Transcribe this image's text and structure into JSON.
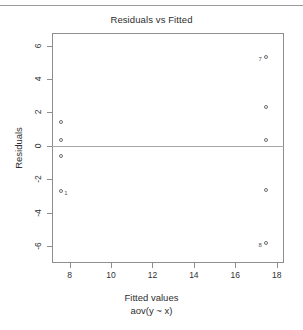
{
  "figure": {
    "title": "Residuals vs Fitted",
    "xlabel": "Fitted values",
    "xsublabel": "aov(y ~ x)",
    "ylabel": "Residuals"
  },
  "colors": {
    "point_stroke": "#6e6e72",
    "zero_line": "#a6a6aa",
    "frame": "#8e8e92",
    "text": "#2e2e2e",
    "page_rule": "#9a9a9e"
  },
  "chart_data": {
    "type": "scatter",
    "title": "Residuals vs Fitted",
    "xlabel": "Fitted values",
    "xsublabel": "aov(y ~ x)",
    "ylabel": "Residuals",
    "xlim": [
      7.15,
      18.35
    ],
    "ylim": [
      -7.0,
      6.75
    ],
    "xticks": [
      8,
      10,
      12,
      14,
      16,
      18
    ],
    "yticks": [
      6,
      4,
      2,
      0,
      -2,
      -4,
      -6
    ],
    "grid": false,
    "legend": null,
    "reference_lines": [
      {
        "name": "zero-residual-line",
        "orientation": "horizontal",
        "y": 0
      }
    ],
    "points": [
      {
        "x": 7.6,
        "y": 1.4,
        "label": ""
      },
      {
        "x": 7.6,
        "y": 0.35,
        "label": ""
      },
      {
        "x": 7.6,
        "y": -0.6,
        "label": ""
      },
      {
        "x": 7.6,
        "y": -2.7,
        "label": "1"
      },
      {
        "x": 17.5,
        "y": 5.3,
        "label": "7"
      },
      {
        "x": 17.5,
        "y": 2.35,
        "label": ""
      },
      {
        "x": 17.5,
        "y": 0.35,
        "label": ""
      },
      {
        "x": 17.5,
        "y": -2.65,
        "label": ""
      },
      {
        "x": 17.5,
        "y": -5.8,
        "label": "8"
      }
    ]
  }
}
